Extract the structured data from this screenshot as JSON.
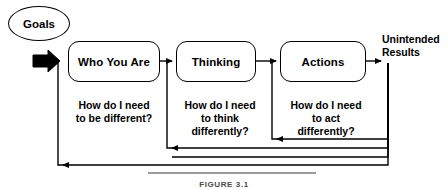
{
  "diagram": {
    "title_caption": "FIGURE 3.1",
    "colors": {
      "stroke": "#000000",
      "background": "#ffffff",
      "caption": "#4a4a4a",
      "rule": "#9a9a9a"
    },
    "start_node": {
      "label": "Goals",
      "shape": "ellipse"
    },
    "stages": [
      {
        "id": "who-you-are",
        "label": "Who You Are",
        "question": "How do I need\nto be different?"
      },
      {
        "id": "thinking",
        "label": "Thinking",
        "question": "How do I need\nto think\ndifferently?"
      },
      {
        "id": "actions",
        "label": "Actions",
        "question": "How do I need\nto act\ndifferently?"
      }
    ],
    "end_node": {
      "label": "Unintended\nResults"
    },
    "connectors": [
      {
        "id": "goals-to-who",
        "kind": "block-arrow",
        "from": "Goals",
        "to": "Who You Are"
      },
      {
        "id": "who-to-thinking",
        "kind": "arrow",
        "from": "Who You Are",
        "to": "Thinking"
      },
      {
        "id": "thinking-to-actions",
        "kind": "arrow",
        "from": "Thinking",
        "to": "Actions"
      },
      {
        "id": "actions-to-results",
        "kind": "arrow",
        "from": "Actions",
        "to": "Unintended Results"
      },
      {
        "id": "feedback-results-to-thinking",
        "kind": "feedback-loop",
        "from": "Unintended Results",
        "to": "Thinking"
      },
      {
        "id": "feedback-results-to-actions",
        "kind": "feedback-loop",
        "from": "Unintended Results",
        "to": "Actions"
      },
      {
        "id": "feedback-results-to-who",
        "kind": "feedback-loop",
        "from": "Unintended Results",
        "to": "Who You Are"
      }
    ]
  }
}
